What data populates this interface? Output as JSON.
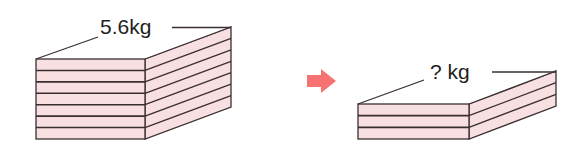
{
  "diagram": {
    "left_stack": {
      "label": "5.6kg",
      "layers": 7
    },
    "arrow": {
      "icon": "arrow-right-icon",
      "color": "#f87272"
    },
    "right_stack": {
      "label": "? kg",
      "layers": 3
    },
    "colors": {
      "face": "#f8dfe2",
      "stroke": "#3a2f30"
    }
  }
}
